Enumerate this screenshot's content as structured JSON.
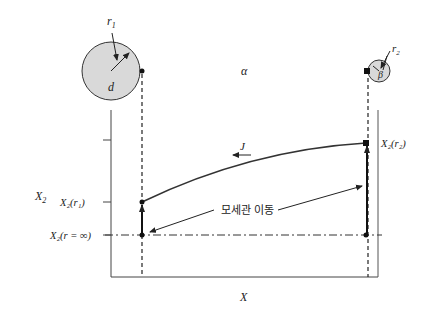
{
  "diagram": {
    "type": "capillary-diffusion-diagram",
    "labels": {
      "r1": "r",
      "r1_sub": "1",
      "r2": "r",
      "r2_sub": "2",
      "d": "d",
      "alpha": "α",
      "beta": "β",
      "J": "J",
      "X2_axis": "X",
      "X2_axis_sub": "2",
      "X_axis": "X",
      "X2_r1": "X₂(r₁)",
      "X2_r2": "X₂(r₂)",
      "X2_rinf": "X₂(r = ∞)",
      "capillary_transport": "모세관 이동"
    },
    "colors": {
      "line": "#333333",
      "circle_fill": "#d9d9d9",
      "background": "#ffffff"
    }
  }
}
